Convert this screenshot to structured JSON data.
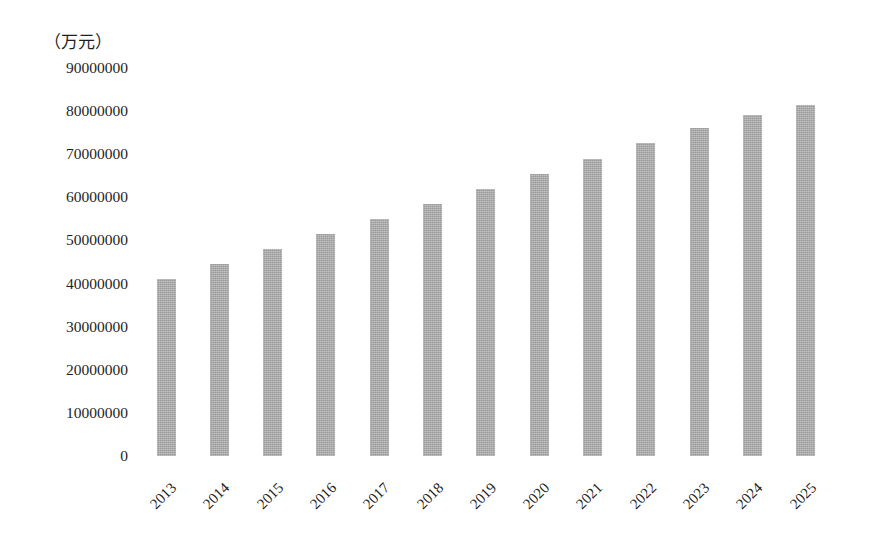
{
  "chart_data": {
    "type": "bar",
    "title": "",
    "subtitle": "",
    "xlabel": "（年份）",
    "ylabel": "（万元）",
    "categories": [
      "2013",
      "2014",
      "2015",
      "2016",
      "2017",
      "2018",
      "2019",
      "2020",
      "2021",
      "2022",
      "2023",
      "2024",
      "2025"
    ],
    "values": [
      41000000,
      44500000,
      48000000,
      51500000,
      55000000,
      58500000,
      62000000,
      65500000,
      69000000,
      72500000,
      76000000,
      79000000,
      81500000
    ],
    "series": [
      {
        "name": "",
        "values": [
          41000000,
          44500000,
          48000000,
          51500000,
          55000000,
          58500000,
          62000000,
          65500000,
          69000000,
          72500000,
          76000000,
          79000000,
          81500000
        ]
      }
    ],
    "ylim": [
      0,
      90000000
    ],
    "ytick_values": [
      0,
      10000000,
      20000000,
      30000000,
      40000000,
      50000000,
      60000000,
      70000000,
      80000000,
      90000000
    ],
    "ytick_labels": [
      "0",
      "10000000",
      "20000000",
      "30000000",
      "40000000",
      "50000000",
      "60000000",
      "70000000",
      "80000000",
      "90000000"
    ],
    "grid": false,
    "legend": false,
    "legend_position": "none",
    "bar_color": "#a9a9a9",
    "background_color": "#ffffff",
    "xtick_rotation": -45,
    "annotations": []
  },
  "axes": {
    "y_unit": "（万元）",
    "x_unit": "（年份）"
  }
}
